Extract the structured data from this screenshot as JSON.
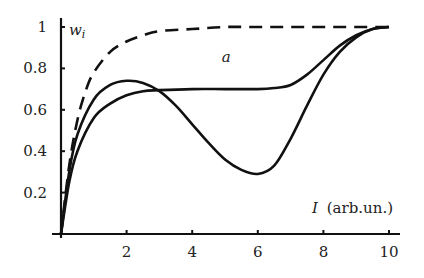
{
  "chart_data": {
    "type": "line",
    "title": "",
    "xlabel": "I (arb.un.)",
    "xlabel_var": "I",
    "xlabel_unit": "(arb.un.)",
    "ylabel": "w_i",
    "xlim": [
      0,
      10
    ],
    "ylim": [
      0,
      1
    ],
    "grid": false,
    "legend": null,
    "x_ticks": [
      2,
      4,
      6,
      8,
      10
    ],
    "x_tick_labels": [
      "2",
      "4",
      "6",
      "8",
      "10"
    ],
    "y_ticks": [
      0.2,
      0.4,
      0.6,
      0.8,
      1
    ],
    "y_tick_labels": [
      "0.2",
      "0.4",
      "0.6",
      "0.8",
      "1"
    ],
    "annotations": [
      {
        "text": "a",
        "x": 4.9,
        "y": 0.83
      }
    ],
    "series": [
      {
        "name": "dashed",
        "style": "dashed",
        "x": [
          0,
          0.25,
          0.5,
          0.75,
          1,
          1.5,
          2,
          2.5,
          3,
          4,
          5,
          6,
          7,
          8,
          9,
          10
        ],
        "y": [
          0,
          0.33,
          0.55,
          0.69,
          0.78,
          0.88,
          0.93,
          0.96,
          0.98,
          0.99,
          1.0,
          1.0,
          1.0,
          1.0,
          1.0,
          1.0
        ]
      },
      {
        "name": "solid-dip",
        "style": "solid",
        "x": [
          0,
          0.25,
          0.5,
          1,
          1.5,
          2,
          2.5,
          3,
          3.5,
          4,
          4.5,
          5,
          5.5,
          6,
          6.5,
          7,
          7.5,
          8,
          8.5,
          9,
          9.5,
          10
        ],
        "y": [
          0,
          0.3,
          0.48,
          0.65,
          0.72,
          0.74,
          0.73,
          0.69,
          0.62,
          0.53,
          0.44,
          0.36,
          0.31,
          0.29,
          0.33,
          0.46,
          0.62,
          0.77,
          0.88,
          0.95,
          0.99,
          1.0
        ]
      },
      {
        "name": "solid-plateau",
        "style": "solid",
        "x": [
          0,
          0.25,
          0.5,
          1,
          1.5,
          2,
          2.5,
          3,
          4,
          5,
          6,
          6.5,
          7,
          7.5,
          8,
          8.5,
          9,
          9.5,
          10
        ],
        "y": [
          0,
          0.25,
          0.4,
          0.56,
          0.63,
          0.67,
          0.69,
          0.695,
          0.7,
          0.7,
          0.7,
          0.705,
          0.72,
          0.77,
          0.84,
          0.91,
          0.96,
          0.99,
          1.0
        ]
      }
    ]
  }
}
